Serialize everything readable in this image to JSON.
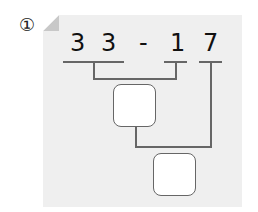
{
  "problem": {
    "marker": "①",
    "expression": {
      "tokens": [
        "3",
        "3",
        "-",
        "1",
        "7"
      ]
    },
    "answer_boxes": [
      {
        "label": "partial-result",
        "value": ""
      },
      {
        "label": "final-result",
        "value": ""
      }
    ]
  }
}
